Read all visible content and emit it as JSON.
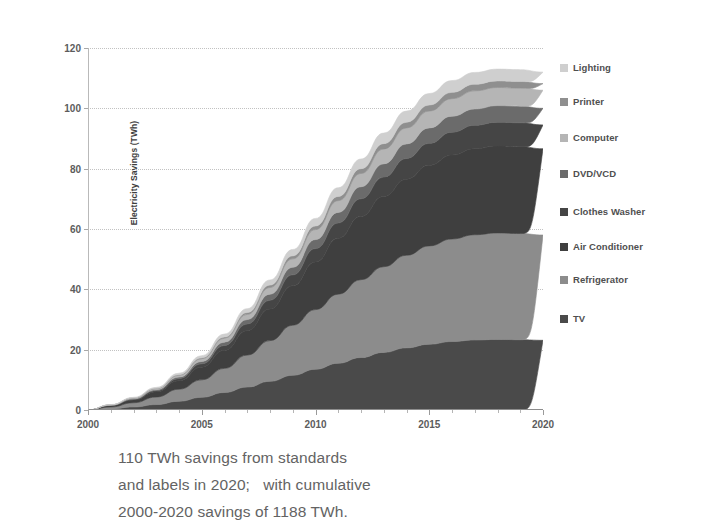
{
  "chart_data": {
    "type": "area",
    "title": "",
    "subtitle": "",
    "xlabel": "",
    "ylabel": "Electricity Savings (TWh)",
    "xlim": [
      2000,
      2020
    ],
    "ylim": [
      0,
      120
    ],
    "x_ticks": [
      "2000",
      "2005",
      "2010",
      "2015",
      "2020"
    ],
    "y_ticks": [
      "0",
      "20",
      "40",
      "60",
      "80",
      "100",
      "120"
    ],
    "grid": true,
    "stacked": true,
    "legend_position": "right",
    "x": [
      2000,
      2001,
      2002,
      2003,
      2004,
      2005,
      2006,
      2007,
      2008,
      2009,
      2010,
      2011,
      2012,
      2013,
      2014,
      2015,
      2016,
      2017,
      2018,
      2019,
      2020
    ],
    "series": [
      {
        "name": "TV",
        "color": "#4a4a4a",
        "values": [
          0,
          0.4,
          1.0,
          1.8,
          2.9,
          4.2,
          5.8,
          7.6,
          9.5,
          11.5,
          13.5,
          15.5,
          17.4,
          19.1,
          20.6,
          21.8,
          22.7,
          23.2,
          23.4,
          23.3,
          23.1
        ]
      },
      {
        "name": "Refrigerator",
        "color": "#8c8c8c",
        "values": [
          0,
          0.6,
          1.4,
          2.5,
          4.0,
          5.8,
          8.0,
          10.6,
          13.5,
          16.6,
          19.8,
          22.9,
          25.8,
          28.4,
          30.7,
          32.6,
          34.0,
          34.9,
          35.3,
          35.2,
          34.9
        ]
      },
      {
        "name": "Air Conditioner",
        "color": "#3f3f3f",
        "values": [
          0,
          0.4,
          0.9,
          1.7,
          2.8,
          4.2,
          6.0,
          8.1,
          10.5,
          13.1,
          15.8,
          18.5,
          21.0,
          23.3,
          25.2,
          26.7,
          27.8,
          28.5,
          28.8,
          28.8,
          28.6
        ]
      },
      {
        "name": "Clothes Washer",
        "color": "#454545",
        "values": [
          0,
          0.1,
          0.2,
          0.4,
          0.7,
          1.1,
          1.6,
          2.2,
          2.9,
          3.6,
          4.4,
          5.1,
          5.8,
          6.4,
          6.9,
          7.3,
          7.6,
          7.8,
          7.9,
          7.9,
          7.9
        ]
      },
      {
        "name": "DVD/VCD",
        "color": "#6b6b6b",
        "values": [
          0,
          0.1,
          0.2,
          0.3,
          0.5,
          0.8,
          1.1,
          1.5,
          2.0,
          2.5,
          3.0,
          3.5,
          4.0,
          4.4,
          4.8,
          5.1,
          5.3,
          5.4,
          5.5,
          5.5,
          5.5
        ]
      },
      {
        "name": "Computer",
        "color": "#b5b5b5",
        "values": [
          0,
          0.1,
          0.2,
          0.4,
          0.6,
          0.9,
          1.3,
          1.7,
          2.2,
          2.8,
          3.3,
          3.9,
          4.4,
          4.9,
          5.3,
          5.6,
          5.8,
          6.0,
          6.0,
          6.0,
          6.0
        ]
      },
      {
        "name": "Printer",
        "color": "#8f8f8f",
        "values": [
          0,
          0.0,
          0.1,
          0.1,
          0.2,
          0.3,
          0.4,
          0.6,
          0.8,
          1.0,
          1.2,
          1.4,
          1.6,
          1.8,
          1.9,
          2.0,
          2.1,
          2.2,
          2.2,
          2.2,
          2.2
        ]
      },
      {
        "name": "Lighting",
        "color": "#cfcfcf",
        "values": [
          0,
          0.1,
          0.2,
          0.3,
          0.5,
          0.7,
          1.0,
          1.3,
          1.7,
          2.1,
          2.5,
          2.9,
          3.2,
          3.5,
          3.7,
          3.8,
          3.9,
          3.9,
          3.9,
          3.9,
          3.8
        ]
      }
    ],
    "totals_2020": 112,
    "annotations": [
      "110 TWh savings from standards",
      "and labels in 2020;   with cumulative",
      "2000-2020 savings of 1188 TWh."
    ]
  },
  "axes": {
    "y_title": "Electricity Savings (TWh)",
    "y_ticks": [
      {
        "label": "120",
        "value": 120
      },
      {
        "label": "100",
        "value": 100
      },
      {
        "label": "80",
        "value": 80
      },
      {
        "label": "60",
        "value": 60
      },
      {
        "label": "40",
        "value": 40
      },
      {
        "label": "20",
        "value": 20
      },
      {
        "label": "0",
        "value": 0
      }
    ],
    "x_ticks": [
      {
        "label": "2000",
        "value": 2000
      },
      {
        "label": "2005",
        "value": 2005
      },
      {
        "label": "2010",
        "value": 2010
      },
      {
        "label": "2015",
        "value": 2015
      },
      {
        "label": "2020",
        "value": 2020
      }
    ]
  },
  "legend": {
    "items": [
      {
        "label": "Lighting",
        "color": "#cfcfcf"
      },
      {
        "label": "Printer",
        "color": "#8f8f8f"
      },
      {
        "label": "Computer",
        "color": "#b5b5b5"
      },
      {
        "label": "DVD/VCD",
        "color": "#6b6b6b"
      },
      {
        "label": "Clothes Washer",
        "color": "#454545"
      },
      {
        "label": "Air Conditioner",
        "color": "#3f3f3f"
      },
      {
        "label": "Refrigerator",
        "color": "#8c8c8c"
      },
      {
        "label": "TV",
        "color": "#4a4a4a"
      }
    ]
  },
  "caption": {
    "line1": "110 TWh savings from standards",
    "line2": "and labels in 2020;   with cumulative",
    "line3": "2000-2020 savings of 1188 TWh."
  }
}
